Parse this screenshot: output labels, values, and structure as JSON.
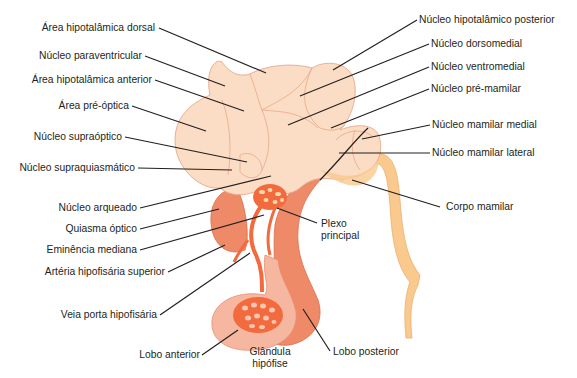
{
  "diagram": {
    "colors": {
      "hypothalamus_fill": "#fbdcc4",
      "hypothalamus_stroke": "#e9a889",
      "mammillary_fill": "#f9c98e",
      "vessel": "#f26a3e",
      "anterior_lobe": "#f6b7a0",
      "posterior_lobe": "#ef8a68",
      "leader_line": "#231f20"
    },
    "labels_left": [
      {
        "id": "area-hipotalamica-dorsal",
        "text": "Área hipotalâmica dorsal"
      },
      {
        "id": "nucleo-paraventricular",
        "text": "Núcleo paraventricular"
      },
      {
        "id": "area-hipotalamica-anterior",
        "text": "Área hipotalâmica anterior"
      },
      {
        "id": "area-pre-optica",
        "text": "Área pré-óptica"
      },
      {
        "id": "nucleo-supraoptico",
        "text": "Núcleo supraóptico"
      },
      {
        "id": "nucleo-supraquiasmatico",
        "text": "Núcleo supraquiasmático"
      },
      {
        "id": "nucleo-arqueado",
        "text": "Núcleo arqueado"
      },
      {
        "id": "quiasma-optico",
        "text": "Quiasma óptico"
      },
      {
        "id": "eminencia-mediana",
        "text": "Eminência mediana"
      },
      {
        "id": "arteria-hipofisaria-superior",
        "text": "Artéria hipofisária superior"
      },
      {
        "id": "veia-porta-hipofisaria",
        "text": "Veia porta hipofisária"
      },
      {
        "id": "lobo-anterior",
        "text": "Lobo anterior"
      }
    ],
    "labels_right": [
      {
        "id": "nucleo-hipotalamico-posterior",
        "text": "Núcleo hipotalâmico posterior"
      },
      {
        "id": "nucleo-dorsomedial",
        "text": "Núcleo dorsomedial"
      },
      {
        "id": "nucleo-ventromedial",
        "text": "Núcleo ventromedial"
      },
      {
        "id": "nucleo-pre-mamilar",
        "text": "Núcleo pré-mamilar"
      },
      {
        "id": "nucleo-mamilar-medial",
        "text": "Núcleo mamilar medial"
      },
      {
        "id": "nucleo-mamilar-lateral",
        "text": "Núcleo mamilar lateral"
      },
      {
        "id": "corpo-mamilar",
        "text": "Corpo mamilar"
      },
      {
        "id": "lobo-posterior",
        "text": "Lobo posterior"
      }
    ],
    "labels_center": [
      {
        "id": "plexo-principal",
        "line1": "Plexo",
        "line2": "principal"
      },
      {
        "id": "glandula-hipofise",
        "line1": "Glândula",
        "line2": "hipófise"
      }
    ]
  }
}
